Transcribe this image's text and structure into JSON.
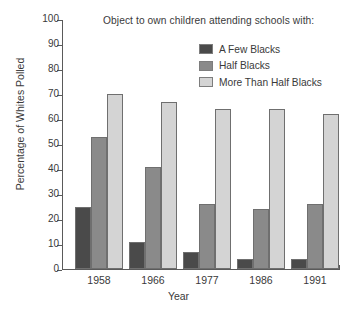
{
  "chart_data": {
    "type": "bar",
    "title": "Object to own children attending schools with:",
    "xlabel": "Year",
    "ylabel": "Percentage of Whites Polled",
    "categories": [
      "1958",
      "1966",
      "1977",
      "1986",
      "1991"
    ],
    "series": [
      {
        "name": "A Few Blacks",
        "color": "#4a4a4a",
        "values": [
          25,
          11,
          7,
          4,
          4
        ]
      },
      {
        "name": "Half Blacks",
        "color": "#8a8a8a",
        "values": [
          53,
          41,
          26,
          24,
          26
        ]
      },
      {
        "name": "More Than Half Blacks",
        "color": "#d4d4d4",
        "values": [
          70,
          67,
          64,
          64,
          62
        ]
      }
    ],
    "ylim": [
      0,
      100
    ],
    "yticks": [
      0,
      10,
      20,
      30,
      40,
      50,
      60,
      70,
      80,
      90,
      100
    ],
    "ytick_labels": [
      "0",
      "10",
      "20",
      "30",
      "40",
      "50",
      "60",
      "70",
      "80",
      "90",
      "100"
    ],
    "grid": false,
    "legend_position": "top-right"
  }
}
